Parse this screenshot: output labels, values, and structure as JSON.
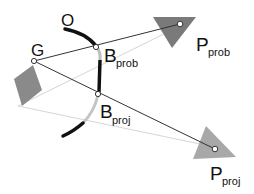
{
  "labels": {
    "O": "O",
    "G": "G",
    "B_prob_main": "B",
    "B_prob_sub": "prob",
    "B_proj_main": "B",
    "B_proj_sub": "proj",
    "P_prob_main": "P",
    "P_prob_sub": "prob",
    "P_proj_main": "P",
    "P_proj_sub": "proj"
  },
  "colors": {
    "dark_line": "#333333",
    "light_line": "#d0d0d0",
    "curve_black": "#111111",
    "curve_gray": "#bdbdbd",
    "diamond": "#8a8a8a",
    "triangle_prob": "#7a7a7a",
    "triangle_proj": "#a8a8a8"
  }
}
